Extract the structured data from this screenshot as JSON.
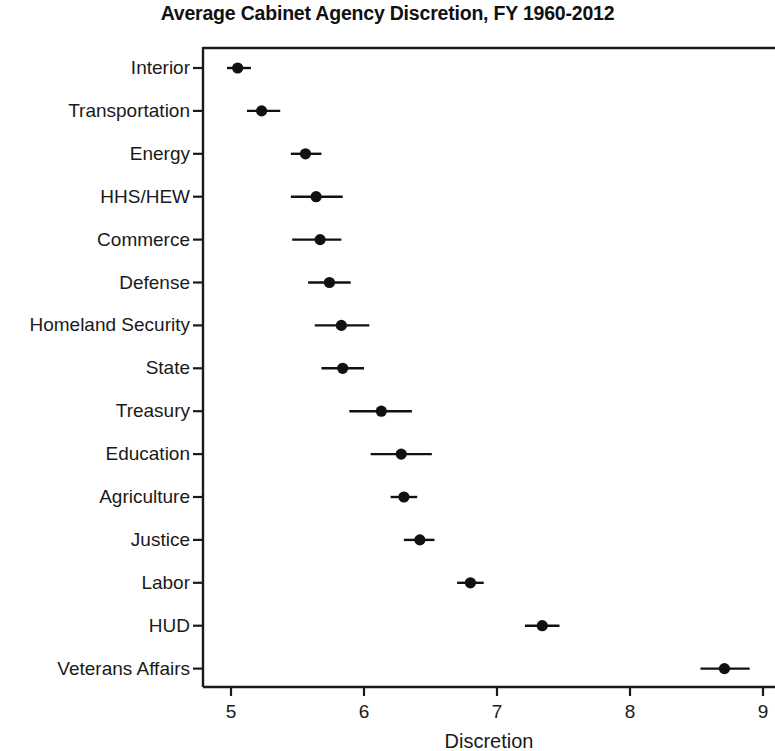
{
  "chart_data": {
    "type": "scatter",
    "title": "Average Cabinet Agency Discretion, FY 1960-2012",
    "xlabel": "Discretion",
    "ylabel": "",
    "xlim": [
      4.79,
      9.09
    ],
    "xticks": [
      5,
      6,
      7,
      8,
      9
    ],
    "xtick_labels": [
      "5",
      "6",
      "7",
      "8",
      "9"
    ],
    "grid": false,
    "legend": null,
    "orientation": "horizontal",
    "categories": [
      "Interior",
      "Transportation",
      "Energy",
      "HHS/HEW",
      "Commerce",
      "Defense",
      "Homeland Security",
      "State",
      "Treasury",
      "Education",
      "Agriculture",
      "Justice",
      "Labor",
      "HUD",
      "Veterans Affairs"
    ],
    "values": [
      5.05,
      5.23,
      5.56,
      5.64,
      5.67,
      5.74,
      5.83,
      5.84,
      6.13,
      6.28,
      6.3,
      6.42,
      6.8,
      7.34,
      8.71
    ],
    "ci_low": [
      4.97,
      5.12,
      5.45,
      5.45,
      5.46,
      5.58,
      5.63,
      5.68,
      5.89,
      6.05,
      6.2,
      6.3,
      6.7,
      7.21,
      8.53
    ],
    "ci_high": [
      5.15,
      5.37,
      5.68,
      5.84,
      5.83,
      5.9,
      6.04,
      6.0,
      6.36,
      6.51,
      6.4,
      6.53,
      6.9,
      7.47,
      8.9
    ],
    "point_color": "#111111",
    "line_color": "#111111",
    "axis_color": "#1a1a1a"
  }
}
